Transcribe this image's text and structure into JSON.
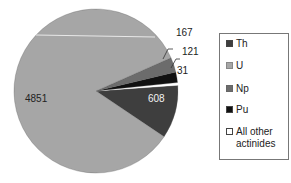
{
  "chart_data": {
    "type": "pie",
    "title": "",
    "categories": [
      "Th",
      "U",
      "Np",
      "Pu",
      "All other actinides"
    ],
    "values": [
      608,
      4851,
      167,
      121,
      31
    ],
    "colors": [
      "#3e3e3e",
      "#a6a6a6",
      "#6c6c6c",
      "#111111",
      "#ffffff"
    ],
    "data_labels": [
      "608",
      "4851",
      "167",
      "121",
      "31"
    ],
    "legend_position": "right"
  },
  "labels": {
    "th": "608",
    "u": "4851",
    "np": "167",
    "pu": "121",
    "other": "31"
  },
  "legend": {
    "th": "Th",
    "u": "U",
    "np": "Np",
    "pu": "Pu",
    "other_line1": "All other",
    "other_line2": "actinides"
  }
}
